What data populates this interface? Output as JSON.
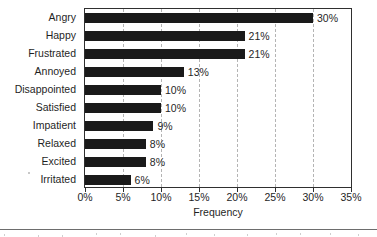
{
  "chart_data": {
    "type": "bar",
    "orientation": "horizontal",
    "title": "",
    "xlabel": "Frequency",
    "ylabel": "",
    "categories": [
      "Angry",
      "Happy",
      "Frustrated",
      "Annoyed",
      "Disappointed",
      "Satisfied",
      "Impatient",
      "Relaxed",
      "Excited",
      "Irritated"
    ],
    "values": [
      30,
      21,
      21,
      13,
      10,
      10,
      9,
      8,
      8,
      6
    ],
    "value_labels": [
      "30%",
      "21%",
      "21%",
      "13%",
      "10%",
      "10%",
      "9%",
      "8%",
      "8%",
      "6%"
    ],
    "xlim": [
      0,
      35
    ],
    "xticks": [
      0,
      5,
      10,
      15,
      20,
      25,
      30,
      35
    ],
    "xtick_labels": [
      "0%",
      "5%",
      "10%",
      "15%",
      "20%",
      "25%",
      "30%",
      "35%"
    ],
    "grid": true,
    "grid_axis": "x",
    "grid_style": "dashed",
    "legend": false,
    "bar_color": "#1a1a1a",
    "grid_color": "#b4b4b4",
    "axis_color": "#2f2f2f",
    "text_color": "#1f1f1f",
    "background_color": "#ffffff"
  }
}
